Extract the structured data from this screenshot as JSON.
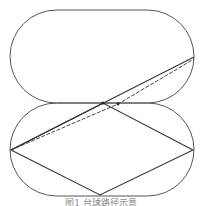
{
  "figure": {
    "caption": "图1 台球路径示意",
    "stroke_color": "#333333",
    "outline_color": "#555555",
    "top_stadium": {
      "x": 10,
      "y": 10,
      "width": 184,
      "height": 93,
      "radius": 46.5
    },
    "bottom_stadium": {
      "x": 10,
      "y": 103,
      "width": 184,
      "height": 93,
      "radius": 46.5
    },
    "rhombus": {
      "points": [
        [
          11,
          150
        ],
        [
          103,
          103
        ],
        [
          193,
          150
        ],
        [
          100,
          195
        ]
      ]
    },
    "solid_ray": {
      "from": [
        11,
        150
      ],
      "to": [
        194,
        57
      ]
    },
    "dashed_ray": {
      "from": [
        11,
        150
      ],
      "via": [
        118,
        104
      ],
      "to": [
        194,
        59
      ]
    },
    "markers": [
      [
        103,
        103
      ],
      [
        118,
        104
      ]
    ]
  }
}
